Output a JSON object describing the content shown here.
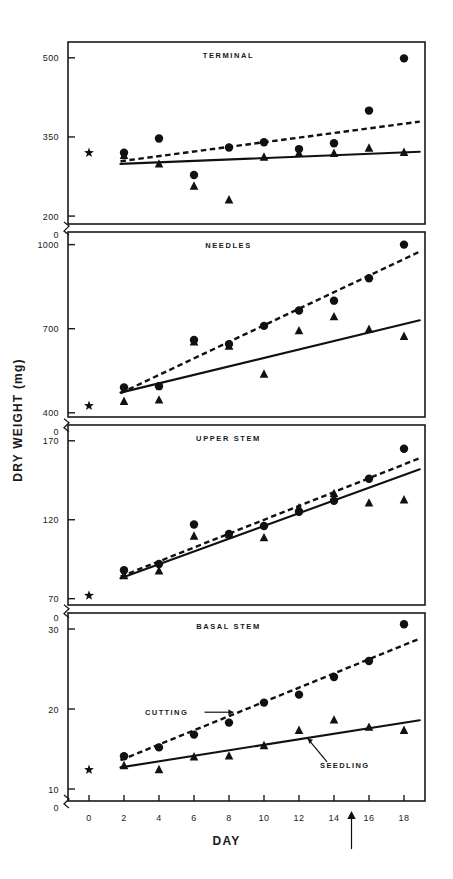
{
  "figure": {
    "y_axis_label": "DRY WEIGHT (mg)",
    "x_axis_label": "DAY",
    "annotations": {
      "cutting_label": "CUTTING",
      "seedling_label": "SEEDLING",
      "x_marker_day": 15
    }
  },
  "chart_data": [
    {
      "type": "scatter",
      "title": "TERMINAL",
      "xlabel": "DAY",
      "ylabel": "DRY WEIGHT (mg)",
      "xlim": [
        -1.2,
        19.2
      ],
      "ylim": [
        185,
        530
      ],
      "xticks": [
        0,
        2,
        4,
        6,
        8,
        10,
        12,
        14,
        16,
        18
      ],
      "yticks": [
        200,
        350,
        500
      ],
      "ytick_labels": [
        "200",
        "350",
        "500"
      ],
      "y_break_label": "0",
      "grid": false,
      "legend": "none",
      "initial_star": {
        "x": 0,
        "y": 320
      },
      "series": [
        {
          "name": "CUTTING",
          "marker": "circle",
          "line": "dashed",
          "x": [
            2,
            4,
            6,
            8,
            10,
            12,
            14,
            16,
            18
          ],
          "values": [
            320,
            347,
            278,
            330,
            340,
            327,
            338,
            400,
            499
          ],
          "fit_start": [
            1.8,
            304
          ],
          "fit_end": [
            18.9,
            379
          ]
        },
        {
          "name": "SEEDLING",
          "marker": "triangle",
          "line": "solid",
          "x": [
            2,
            4,
            6,
            8,
            10,
            12,
            14,
            16,
            18
          ],
          "values": [
            316,
            300,
            258,
            232,
            313,
            320,
            320,
            330,
            322
          ],
          "fit_start": [
            1.8,
            299
          ],
          "fit_end": [
            18.9,
            322
          ]
        }
      ]
    },
    {
      "type": "scatter",
      "title": "NEEDLES",
      "xlabel": "DAY",
      "ylabel": "DRY WEIGHT (mg)",
      "xlim": [
        -1.2,
        19.2
      ],
      "ylim": [
        385,
        1045
      ],
      "xticks": [
        0,
        2,
        4,
        6,
        8,
        10,
        12,
        14,
        16,
        18
      ],
      "yticks": [
        400,
        700,
        1000
      ],
      "ytick_labels": [
        "400",
        "700",
        "1000"
      ],
      "y_break_label": "0",
      "grid": false,
      "legend": "none",
      "initial_star": {
        "x": 0,
        "y": 425
      },
      "series": [
        {
          "name": "CUTTING",
          "marker": "circle",
          "line": "dashed",
          "x": [
            2,
            4,
            6,
            8,
            10,
            12,
            14,
            16,
            18
          ],
          "values": [
            490,
            495,
            660,
            645,
            710,
            765,
            800,
            880,
            1000
          ],
          "fit_start": [
            1.8,
            470
          ],
          "fit_end": [
            18.9,
            975
          ]
        },
        {
          "name": "SEEDLING",
          "marker": "triangle",
          "line": "solid",
          "x": [
            2,
            4,
            6,
            8,
            10,
            12,
            14,
            16,
            18
          ],
          "values": [
            443,
            448,
            655,
            640,
            540,
            695,
            745,
            700,
            675
          ],
          "fit_start": [
            1.8,
            472
          ],
          "fit_end": [
            18.9,
            730
          ]
        }
      ]
    },
    {
      "type": "scatter",
      "title": "UPPER STEM",
      "xlabel": "DAY",
      "ylabel": "DRY WEIGHT (mg)",
      "xlim": [
        -1.2,
        19.2
      ],
      "ylim": [
        66,
        180
      ],
      "xticks": [
        0,
        2,
        4,
        6,
        8,
        10,
        12,
        14,
        16,
        18
      ],
      "yticks": [
        70,
        120,
        170
      ],
      "ytick_labels": [
        "70",
        "120",
        "170"
      ],
      "y_break_label": "0",
      "grid": false,
      "legend": "none",
      "initial_star": {
        "x": 0,
        "y": 72
      },
      "series": [
        {
          "name": "CUTTING",
          "marker": "circle",
          "line": "dashed",
          "x": [
            2,
            4,
            6,
            8,
            10,
            12,
            14,
            16,
            18
          ],
          "values": [
            88,
            92,
            117,
            111,
            116,
            125,
            132,
            146,
            165
          ],
          "fit_start": [
            1.8,
            84
          ],
          "fit_end": [
            18.9,
            159
          ]
        },
        {
          "name": "SEEDLING",
          "marker": "triangle",
          "line": "solid",
          "x": [
            2,
            4,
            6,
            8,
            10,
            12,
            14,
            16,
            18
          ],
          "values": [
            85,
            88,
            110,
            111,
            109,
            128,
            137,
            131,
            133
          ],
          "fit_start": [
            1.8,
            83
          ],
          "fit_end": [
            18.9,
            152
          ]
        }
      ]
    },
    {
      "type": "scatter",
      "title": "BASAL STEM",
      "xlabel": "DAY",
      "ylabel": "DRY WEIGHT (mg)",
      "xlim": [
        -1.2,
        19.2
      ],
      "ylim": [
        8.5,
        32
      ],
      "xticks": [
        0,
        2,
        4,
        6,
        8,
        10,
        12,
        14,
        16,
        18
      ],
      "yticks": [
        10,
        20,
        30
      ],
      "ytick_labels": [
        "10",
        "20",
        "30"
      ],
      "y_break_label": "0",
      "grid": false,
      "legend": "inline-arrows",
      "initial_star": {
        "x": 0,
        "y": 12.4
      },
      "series": [
        {
          "name": "CUTTING",
          "marker": "circle",
          "line": "dashed",
          "x": [
            2,
            4,
            6,
            8,
            10,
            12,
            14,
            16,
            18
          ],
          "values": [
            14.1,
            15.2,
            16.8,
            18.3,
            20.8,
            21.8,
            24.0,
            26.0,
            30.6
          ],
          "fit_start": [
            1.8,
            13.6
          ],
          "fit_end": [
            18.9,
            28.8
          ]
        },
        {
          "name": "SEEDLING",
          "marker": "triangle",
          "line": "solid",
          "x": [
            2,
            4,
            6,
            8,
            10,
            12,
            14,
            16,
            18
          ],
          "values": [
            13.0,
            12.5,
            14.1,
            14.2,
            15.5,
            17.4,
            18.7,
            17.8,
            17.4
          ],
          "fit_start": [
            1.8,
            12.7
          ],
          "fit_end": [
            18.9,
            18.6
          ]
        }
      ]
    }
  ],
  "xtick_labels": [
    "0",
    "2",
    "4",
    "6",
    "8",
    "10",
    "12",
    "14",
    "16",
    "18"
  ]
}
